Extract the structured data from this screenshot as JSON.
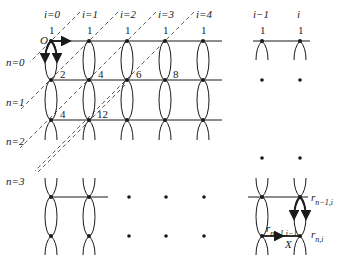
{
  "diagram": {
    "column_labels": [
      "i=0",
      "i=1",
      "i=2",
      "i=3",
      "i=4",
      "i−1",
      "i"
    ],
    "top_values": [
      "1",
      "1",
      "1",
      "1",
      "1",
      "1",
      "1"
    ],
    "origin_label": "O",
    "row_labels": [
      "n=0",
      "n=1",
      "n=2",
      "n=3"
    ],
    "node_values": {
      "row1": [
        "2",
        "4",
        "6",
        "8"
      ],
      "row2": [
        "4",
        "12"
      ]
    },
    "corner_labels": {
      "r_prev_i": "r",
      "r_prev_i_sub": "n−1,i",
      "r_prev_im1": "r",
      "r_prev_im1_sub": "n−1,i−1",
      "r_n_i": "r",
      "r_n_i_sub": "n,i",
      "x_label": "X"
    },
    "colors": {
      "line": "#1a1a1a",
      "dash": "#333333",
      "background": "#ffffff"
    }
  }
}
